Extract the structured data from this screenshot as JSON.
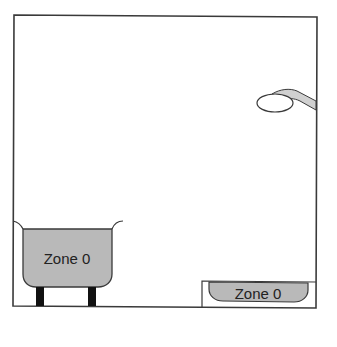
{
  "diagram": {
    "type": "bathroom-zones",
    "colors": {
      "background": "#ffffff",
      "line": "#3a3a3a",
      "zone_fill": "#b9b9b9",
      "legs": "#111111",
      "shower_pipe": "#d0d0d0"
    },
    "frame": {
      "x": 14,
      "y": 15,
      "width": 303,
      "height": 292
    },
    "bath": {
      "label": "Zone 0"
    },
    "shower_tray": {
      "label": "Zone 0"
    },
    "shower_head": {
      "name": "shower head"
    }
  }
}
